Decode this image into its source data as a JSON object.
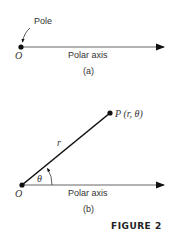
{
  "panel_a": {
    "pole_label": "Pole",
    "origin_label": "O",
    "axis_label": "Polar axis",
    "caption": "(a)"
  },
  "panel_b": {
    "point_label": "P (r, θ)",
    "radius_label": "r",
    "angle_label": "θ",
    "origin_label": "O",
    "axis_label": "Polar axis",
    "caption": "(b)"
  },
  "figure_label": "FIGURE 2",
  "colors": {
    "line": "#111111",
    "axis": "#555555",
    "text": "#333333"
  }
}
